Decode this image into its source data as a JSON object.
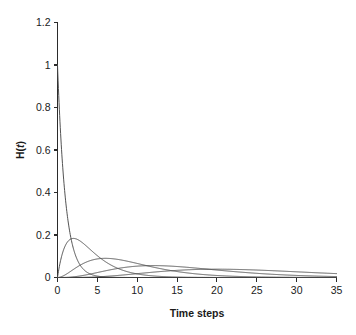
{
  "figure": {
    "background_color": "#ffffff",
    "axis_color": "#2b2b2b",
    "curve_color": "#4a4a4a"
  },
  "chart_data": {
    "type": "line",
    "title": "",
    "subtitle": "",
    "xlabel": "Time steps",
    "ylabel": "H(t)",
    "xlim": [
      0,
      35
    ],
    "ylim": [
      0,
      1.2
    ],
    "xticks": [
      0,
      5,
      10,
      15,
      20,
      25,
      30,
      35
    ],
    "xtick_labels": [
      "0",
      "5",
      "10",
      "15",
      "20",
      "25",
      "30",
      "35"
    ],
    "yticks": [
      0,
      0.2,
      0.4,
      0.6,
      0.8,
      1,
      1.2
    ],
    "ytick_labels": [
      "0",
      "0.2",
      "0.4",
      "0.6",
      "0.8",
      "1",
      "1.2"
    ],
    "grid": false,
    "legend": "none",
    "legend_entries": [],
    "annotations": [],
    "series": [
      {
        "name": "k=1",
        "description": "Erlang shape 1, rate 1 (exponential decay from 1.0 at t=0)",
        "shape": 1,
        "rate": 1.0,
        "peak_x": 0,
        "peak_y": 1.0,
        "x": [
          0,
          0.25,
          0.5,
          0.75,
          1,
          1.5,
          2,
          2.5,
          3,
          4,
          5,
          6,
          7,
          8,
          9,
          10,
          12,
          14,
          16,
          18,
          20,
          25,
          30,
          35
        ],
        "y": [
          1.0,
          0.779,
          0.607,
          0.472,
          0.368,
          0.223,
          0.135,
          0.082,
          0.05,
          0.018,
          0.0067,
          0.0025,
          0.0009,
          0.0003,
          0.0001,
          0.0,
          0.0,
          0.0,
          0.0,
          0.0,
          0.0,
          0.0,
          0.0,
          0.0
        ]
      },
      {
        "name": "k=2",
        "description": "Erlang shape 2, rate 0.5 (peak near t=2)",
        "shape": 2,
        "rate": 0.5,
        "peak_x": 2,
        "peak_y": 0.368,
        "x": [
          0,
          0.5,
          1,
          1.5,
          2,
          2.5,
          3,
          4,
          5,
          6,
          7,
          8,
          10,
          12,
          14,
          16,
          18,
          20,
          25,
          30,
          35
        ],
        "y": [
          0.0,
          0.195,
          0.303,
          0.354,
          0.368,
          0.358,
          0.335,
          0.271,
          0.205,
          0.149,
          0.106,
          0.073,
          0.034,
          0.015,
          0.006,
          0.0027,
          0.0011,
          0.0005,
          0.0,
          0.0,
          0.0
        ]
      },
      {
        "name": "k=3",
        "description": "Erlang shape 3, rate ~0.33 (peak near t=6)",
        "shape": 3,
        "rate": 0.3333,
        "peak_x": 6,
        "peak_y": 0.22,
        "x": [
          0,
          1,
          2,
          3,
          4,
          5,
          6,
          7,
          8,
          9,
          10,
          12,
          14,
          16,
          18,
          20,
          22,
          25,
          30,
          35
        ],
        "y": [
          0.0,
          0.0133,
          0.038,
          0.0681,
          0.0975,
          0.1226,
          0.1418,
          0.1549,
          0.1624,
          0.1652,
          0.1642,
          0.1549,
          0.1383,
          0.1187,
          0.0987,
          0.0804,
          0.0642,
          0.0445,
          0.0224,
          0.0104
        ]
      },
      {
        "name": "k=4",
        "description": "Erlang shape 4, rate 0.25 (peak near t=10.5)",
        "shape": 4,
        "rate": 0.25,
        "peak_x": 10.5,
        "peak_y": 0.18,
        "x": [
          0,
          2,
          4,
          6,
          8,
          10,
          12,
          14,
          16,
          18,
          20,
          22,
          25,
          28,
          30,
          33,
          35
        ],
        "y": [
          0.0,
          0.0063,
          0.0184,
          0.031,
          0.0418,
          0.05,
          0.0556,
          0.0586,
          0.0595,
          0.0585,
          0.0561,
          0.0527,
          0.0462,
          0.039,
          0.0344,
          0.0276,
          0.0235
        ]
      },
      {
        "name": "k=5",
        "description": "Erlang shape 5, rate 0.2 (peak near t=15)",
        "shape": 5,
        "rate": 0.2,
        "peak_x": 15,
        "peak_y": 0.15,
        "x": [
          0,
          2,
          5,
          8,
          10,
          12,
          14,
          15,
          16,
          18,
          20,
          22,
          25,
          28,
          30,
          33,
          35
        ],
        "y": [
          0.0,
          0.0009,
          0.0102,
          0.0281,
          0.0391,
          0.0481,
          0.0544,
          0.0563,
          0.0575,
          0.0581,
          0.0558,
          0.0516,
          0.043,
          0.0338,
          0.0281,
          0.0204,
          0.0162
        ]
      }
    ]
  },
  "axis_labels": {
    "x_title": "Time steps",
    "y_title": "H(t)"
  }
}
